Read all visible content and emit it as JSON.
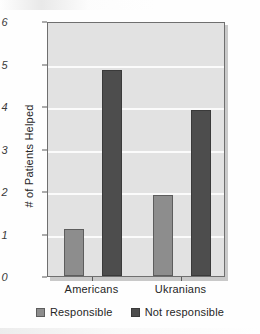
{
  "chart_data": {
    "type": "bar",
    "title": "",
    "xlabel": "",
    "ylabel": "# of Patients Helped",
    "categories": [
      "Americans",
      "Ukranians"
    ],
    "series": [
      {
        "name": "Responsible",
        "values": [
          1.1,
          1.9
        ],
        "color": "#8d8d8d"
      },
      {
        "name": "Not responsible",
        "values": [
          4.85,
          3.9
        ],
        "color": "#4d4d4d"
      }
    ],
    "ylim": [
      0,
      6
    ],
    "ytick_labels": [
      "0",
      "1",
      "2",
      "3",
      "4",
      "5",
      "6"
    ],
    "ytick_values": [
      0,
      1,
      2,
      3,
      4,
      5,
      6
    ],
    "grid": true,
    "legend_position": "bottom",
    "plot_background": "#e2e2e2",
    "gridline_color": "#fbfbfb"
  },
  "axes": {
    "y_title": "# of Patients Helped"
  },
  "legend": {
    "items": [
      {
        "label": "Responsible"
      },
      {
        "label": "Not responsible"
      }
    ]
  }
}
